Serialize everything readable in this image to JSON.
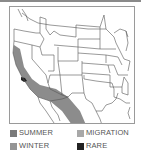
{
  "map": {
    "region": "Western and Central United States",
    "colors": {
      "border": "#555555",
      "frame": "#9a9a9a",
      "range_fill": "#8c8c8c",
      "rare_fill": "#222222",
      "background": "#ffffff"
    }
  },
  "legend": {
    "items": [
      {
        "label": "SUMMER",
        "color": "#7a7a7a"
      },
      {
        "label": "MIGRATION",
        "color": "#a8a8a8"
      },
      {
        "label": "WINTER",
        "color": "#959595"
      },
      {
        "label": "RARE",
        "color": "#222222"
      }
    ]
  }
}
